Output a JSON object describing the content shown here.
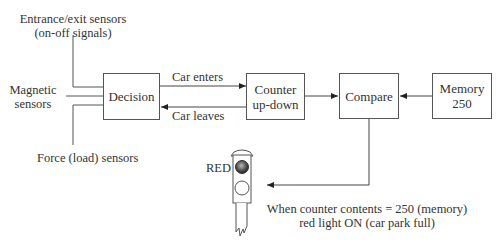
{
  "inputs": {
    "entrance_line1": "Entrance/exit sensors",
    "entrance_line2": "(on-off signals)",
    "magnetic_line1": "Magnetic",
    "magnetic_line2": "sensors",
    "force": "Force (load) sensors"
  },
  "blocks": {
    "decision": "Decision",
    "counter_line1": "Counter",
    "counter_line2": "up-down",
    "compare": "Compare",
    "memory_line1": "Memory",
    "memory_line2": "250"
  },
  "arrows": {
    "car_enters": "Car enters",
    "car_leaves": "Car leaves"
  },
  "signal": {
    "red_label": "RED",
    "red_color": "#333333",
    "off_color": "#ffffff"
  },
  "note": {
    "line1": "When counter contents = 250 (memory)",
    "line2": "red light ON (car park full)"
  }
}
